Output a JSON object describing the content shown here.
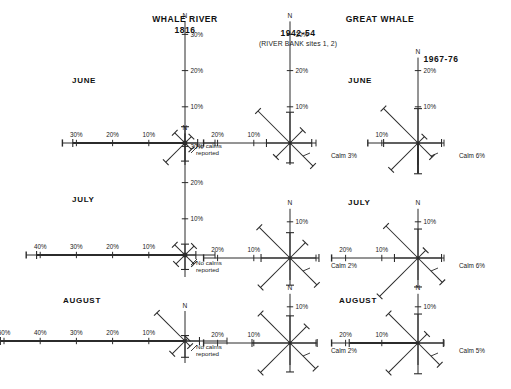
{
  "figure": {
    "background": "#ffffff",
    "ink": "#2b2b2b",
    "text_color": "#1a1a1a"
  },
  "headers": {
    "left_title": "WHALE RIVER",
    "left_years": "1816",
    "right_title": "GREAT WHALE",
    "mid_years": "1942-54",
    "mid_note": "(RIVER BANK sites 1, 2)",
    "far_years": "1967-76"
  },
  "month_labels": {
    "june_left": "JUNE",
    "july_left": "JULY",
    "august_left": "AUGUST",
    "june_right": "JUNE",
    "july_right": "JULY",
    "august_right": "AUGUST"
  },
  "annotations": {
    "no_calms_line1": "No calms",
    "no_calms_line2": "reported",
    "calm_june_mid": "Calm 3%",
    "calm_july_mid": "Calm 2%",
    "calm_august_mid": "Calm 2%",
    "calm_june_far": "Calm 6%",
    "calm_july_far": "Calm 6%",
    "calm_august_far": "Calm 5%"
  },
  "compass": {
    "north_label": "N"
  },
  "chart_data": {
    "type": "wind-rose-grid",
    "units": "percent frequency",
    "directions": [
      "N",
      "NE",
      "E",
      "SE",
      "S",
      "SW",
      "W",
      "NW"
    ],
    "grid": {
      "rows": [
        "JUNE",
        "JULY",
        "AUGUST"
      ],
      "columns": [
        "WHALE RIVER 1816",
        "GREAT WHALE 1942-54",
        "GREAT WHALE 1967-76"
      ]
    },
    "panels": [
      {
        "station": "WHALE RIVER",
        "period": "1816",
        "month": "JUNE",
        "calm": null,
        "calm_text": "No calms reported",
        "scale_axis_n": [
          10,
          20,
          30
        ],
        "scale_axis_w": [
          10,
          20,
          30
        ],
        "values": {
          "N": 4.5,
          "NE": 2.5,
          "E": 3.5,
          "SE": 2.5,
          "S": 5.0,
          "SW": 7.5,
          "W": 31.0,
          "NW": 4.0
        }
      },
      {
        "station": "WHALE RIVER",
        "period": "1816",
        "month": "JULY",
        "calm": null,
        "calm_text": "No calms reported",
        "scale_axis_n": [
          10,
          20,
          30
        ],
        "scale_axis_w": [
          10,
          20,
          30,
          40
        ],
        "values": {
          "N": 3.0,
          "NE": 3.5,
          "E": 3.0,
          "SE": 3.5,
          "S": 4.0,
          "SW": 3.5,
          "W": 41.0,
          "NW": 4.0
        }
      },
      {
        "station": "WHALE RIVER",
        "period": "1816",
        "month": "AUGUST",
        "calm": null,
        "calm_text": "No calms reported",
        "scale_axis_n": [],
        "scale_axis_w": [
          10,
          20,
          30,
          40,
          50
        ],
        "values": {
          "N": 1.5,
          "NE": 1.0,
          "E": 4.0,
          "SE": 2.0,
          "S": 4.5,
          "SW": 5.0,
          "W": 51.0,
          "NW": 11.0
        }
      },
      {
        "station": "GREAT WHALE",
        "period": "1942-54",
        "month": "JUNE",
        "calm": 3,
        "calm_text": "Calm 3%",
        "scale_axis_n": [
          10,
          20,
          30
        ],
        "scale_axis_w": [
          10,
          20
        ],
        "values": {
          "N": 8.5,
          "NE": 5.0,
          "E": 6.0,
          "SE": 9.0,
          "S": 5.5,
          "SW": 5.5,
          "W": 6.5,
          "NW": 12.5
        }
      },
      {
        "station": "GREAT WHALE",
        "period": "1942-54",
        "month": "JULY",
        "calm": 2,
        "calm_text": "Calm 2%",
        "scale_axis_n": [
          10
        ],
        "scale_axis_w": [
          10,
          20
        ],
        "values": {
          "N": 7.0,
          "NE": 6.0,
          "E": 8.0,
          "SE": 10.5,
          "S": 7.5,
          "SW": 11.5,
          "W": 8.0,
          "NW": 12.0
        }
      },
      {
        "station": "GREAT WHALE",
        "period": "1942-54",
        "month": "AUGUST",
        "calm": 2,
        "calm_text": "Calm 2%",
        "scale_axis_n": [
          10
        ],
        "scale_axis_w": [
          10,
          20
        ],
        "values": {
          "N": 7.5,
          "NE": 6.5,
          "E": 7.5,
          "SE": 10.0,
          "S": 8.0,
          "SW": 11.5,
          "W": 10.5,
          "NW": 11.5
        }
      },
      {
        "station": "GREAT WHALE",
        "period": "1967-76",
        "month": "JUNE",
        "calm": 6,
        "calm_text": "Calm 6%",
        "scale_axis_n": [
          10,
          20
        ],
        "scale_axis_w": [
          10
        ],
        "values": {
          "N": 9.5,
          "NE": 2.5,
          "E": 6.5,
          "SE": 5.5,
          "S": 8.5,
          "SW": 10.5,
          "W": 9.5,
          "NW": 13.5
        }
      },
      {
        "station": "GREAT WHALE",
        "period": "1967-76",
        "month": "JULY",
        "calm": 6,
        "calm_text": "Calm 6%",
        "scale_axis_n": [
          10
        ],
        "scale_axis_w": [
          10,
          20
        ],
        "values": {
          "N": 8.0,
          "NE": 3.0,
          "E": 6.5,
          "SE": 9.5,
          "S": 8.0,
          "SW": 15.0,
          "W": 6.5,
          "NW": 12.5
        }
      },
      {
        "station": "GREAT WHALE",
        "period": "1967-76",
        "month": "AUGUST",
        "calm": 5,
        "calm_text": "Calm 5%",
        "scale_axis_n": [
          10
        ],
        "scale_axis_w": [
          10,
          20
        ],
        "values": {
          "N": 8.0,
          "NE": 3.5,
          "E": 7.0,
          "SE": 8.5,
          "S": 8.5,
          "SW": 11.5,
          "W": 19.0,
          "NW": 11.5
        }
      }
    ]
  }
}
